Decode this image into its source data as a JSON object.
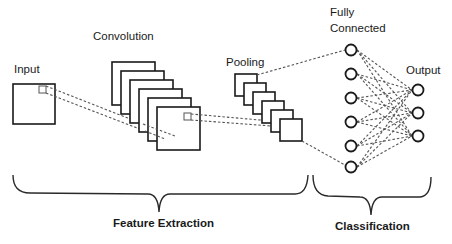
{
  "diagram": {
    "labels": {
      "input": "Input",
      "convolution": "Convolution",
      "pooling": "Pooling",
      "fully_connected_line1": "Fully",
      "fully_connected_line2": "Connected",
      "output": "Output",
      "feature_extraction": "Feature Extraction",
      "classification": "Classification"
    },
    "stages": [
      {
        "name": "Input",
        "maps": 1
      },
      {
        "name": "Convolution",
        "maps": 6
      },
      {
        "name": "Pooling",
        "maps": 6
      },
      {
        "name": "Fully Connected",
        "nodes": 6
      },
      {
        "name": "Output",
        "nodes": 3
      }
    ],
    "groups": [
      {
        "name": "Feature Extraction",
        "spans": [
          "Input",
          "Convolution",
          "Pooling"
        ]
      },
      {
        "name": "Classification",
        "spans": [
          "Fully Connected",
          "Output"
        ]
      }
    ],
    "colors": {
      "stroke": "#1a1a1a",
      "dashed": "#555555",
      "background": "#ffffff"
    }
  }
}
